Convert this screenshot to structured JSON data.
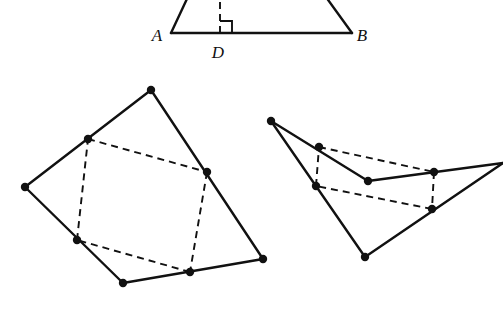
{
  "figure": {
    "background_color": "#ffffff",
    "ink_color": "#111111",
    "width": 503,
    "height": 322,
    "solid_stroke_width": 2.4,
    "dashed_stroke_width": 1.9,
    "dash_pattern": "7,5",
    "vertex_dot_radius": 4.2
  },
  "chart_data": {
    "type": "diagram",
    "title": "",
    "figures": [
      {
        "id": "trapezoid-abd",
        "name": "trapezoid-with-altitude",
        "clipped_at_top": true,
        "solid_polyline": [
          [
            171,
            33
          ],
          [
            352,
            33
          ]
        ],
        "solid_segments": [
          [
            [
              171,
              33
            ],
            [
              193,
              -14
            ]
          ],
          [
            [
              352,
              33
            ],
            [
              318,
              -14
            ]
          ]
        ],
        "dashed_segments": [
          [
            [
              220,
              33
            ],
            [
              220,
              -10
            ]
          ]
        ],
        "right_angle_mark": {
          "corner": [
            220,
            33
          ],
          "size": 12,
          "direction": "upper-right"
        },
        "vertices": [],
        "labels": [
          {
            "text": "A",
            "x": 157,
            "y": 41,
            "anchor": "middle",
            "name": "label-a"
          },
          {
            "text": "B",
            "x": 362,
            "y": 41,
            "anchor": "middle",
            "name": "label-b"
          },
          {
            "text": "D",
            "x": 218,
            "y": 58,
            "anchor": "middle",
            "name": "label-d"
          }
        ]
      },
      {
        "id": "convex-quad-midpoints",
        "name": "convex-quadrilateral-with-midpoint-parallelogram",
        "clipped_at_top": false,
        "outer_polygon": [
          [
            151,
            90
          ],
          [
            263,
            259
          ],
          [
            123,
            283
          ],
          [
            25,
            187
          ]
        ],
        "inner_dashed_polygon": [
          [
            88,
            139
          ],
          [
            207,
            172
          ],
          [
            190,
            272
          ],
          [
            77,
            240
          ]
        ],
        "vertices": [
          [
            151,
            90
          ],
          [
            263,
            259
          ],
          [
            123,
            283
          ],
          [
            25,
            187
          ],
          [
            88,
            139
          ],
          [
            207,
            172
          ],
          [
            190,
            272
          ],
          [
            77,
            240
          ]
        ],
        "labels": []
      },
      {
        "id": "dart-quad-midpoints",
        "name": "nonconvex-quadrilateral-with-midpoint-parallelogram",
        "clipped_at_right": true,
        "outer_polygon": [
          [
            271,
            121
          ],
          [
            368,
            181
          ],
          [
            503,
            163
          ],
          [
            365,
            257
          ]
        ],
        "inner_dashed_polygon": [
          [
            319,
            147
          ],
          [
            434,
            172
          ],
          [
            432,
            209
          ],
          [
            316,
            186
          ]
        ],
        "vertices": [
          [
            271,
            121
          ],
          [
            368,
            181
          ],
          [
            365,
            257
          ],
          [
            319,
            147
          ],
          [
            434,
            172
          ],
          [
            432,
            209
          ],
          [
            316,
            186
          ]
        ],
        "labels": []
      }
    ]
  }
}
